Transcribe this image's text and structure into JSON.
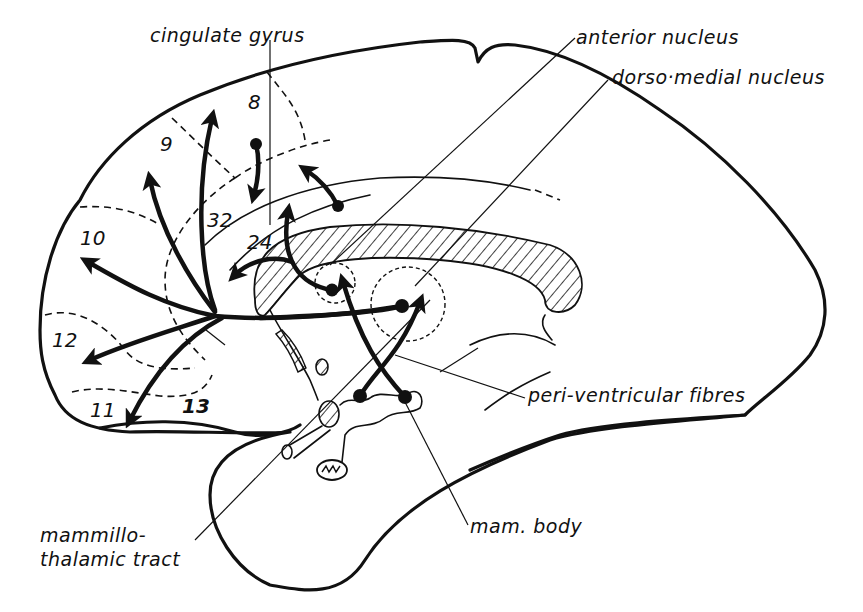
{
  "figure": {
    "type": "sagittal brain section diagram",
    "style": {
      "ink": "#111111",
      "paper": "#ffffff"
    }
  },
  "labels": {
    "cingulate_gyrus": "cingulate gyrus",
    "anterior_nucleus": "anterior nucleus",
    "dorso_medial_nucleus": "dorso·medial nucleus",
    "peri_ventricular_fibres": "peri-ventricular fibres",
    "mam_body": "mam. body",
    "mammillo_thalamic_tract_line1": "mammillo-",
    "mammillo_thalamic_tract_line2": "thalamic tract"
  },
  "areas": {
    "a8": "8",
    "a9": "9",
    "a10": "10",
    "a12": "12",
    "a11": "11",
    "a13": "13",
    "a32": "32",
    "a24": "24"
  }
}
